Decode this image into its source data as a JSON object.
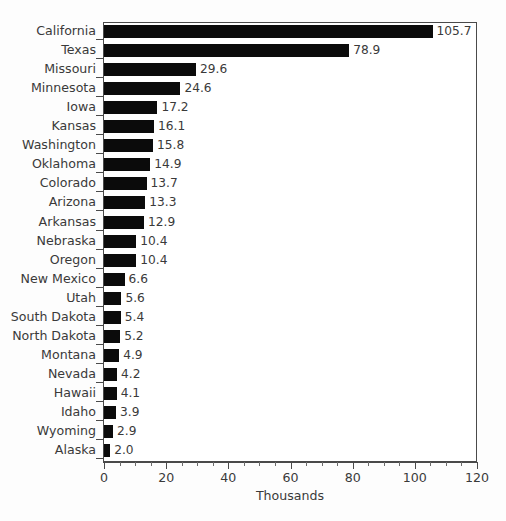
{
  "chart_data": {
    "type": "bar",
    "orientation": "horizontal",
    "title": "",
    "subtitle": "",
    "xlabel": "Thousands",
    "ylabel": "",
    "xlim": [
      0,
      120
    ],
    "xticks": [
      0,
      20,
      40,
      60,
      80,
      100,
      120
    ],
    "xtick_labels": [
      "0",
      "20",
      "40",
      "60",
      "80",
      "100",
      "120"
    ],
    "minor_tick_interval": 5,
    "grid": false,
    "legend": null,
    "bar_color": "#0b0b0b",
    "categories": [
      "California",
      "Texas",
      "Missouri",
      "Minnesota",
      "Iowa",
      "Kansas",
      "Washington",
      "Oklahoma",
      "Colorado",
      "Arizona",
      "Arkansas",
      "Nebraska",
      "Oregon",
      "New Mexico",
      "Utah",
      "South Dakota",
      "North Dakota",
      "Montana",
      "Nevada",
      "Hawaii",
      "Idaho",
      "Wyoming",
      "Alaska"
    ],
    "values": [
      105.7,
      78.9,
      29.6,
      24.6,
      17.2,
      16.1,
      15.8,
      14.9,
      13.7,
      13.3,
      12.9,
      10.4,
      10.4,
      6.6,
      5.6,
      5.4,
      5.2,
      4.9,
      4.2,
      4.1,
      3.9,
      2.9,
      2.0
    ],
    "data_labels": [
      "105.7",
      "78.9",
      "29.6",
      "24.6",
      "17.2",
      "16.1",
      "15.8",
      "14.9",
      "13.7",
      "13.3",
      "12.9",
      "10.4",
      "10.4",
      "6.6",
      "5.6",
      "5.4",
      "5.2",
      "4.9",
      "4.2",
      "4.1",
      "3.9",
      "2.9",
      "2.0"
    ]
  }
}
